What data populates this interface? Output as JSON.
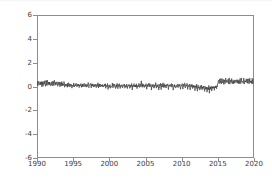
{
  "chart_data": {
    "type": "line",
    "title": "",
    "xlabel": "",
    "ylabel": "",
    "xlim": [
      1990,
      2020
    ],
    "ylim": [
      -6,
      6
    ],
    "grid": false,
    "legend": null,
    "line_color": "#3a3a3a",
    "axis_color": "#8d8d8d",
    "tick_label_color": "#3d3d3d",
    "background_color": "#ffffff",
    "xticks": [
      1990,
      1995,
      2000,
      2005,
      2010,
      2015,
      2020
    ],
    "xtick_labels": [
      "1990",
      "1995",
      "2000",
      "2005",
      "2010",
      "2015",
      "2020"
    ],
    "yticks": [
      -6,
      -4,
      -2,
      0,
      2,
      4,
      6
    ],
    "ytick_labels": [
      "-6",
      "-4",
      "-2",
      "0",
      "2",
      "4",
      "6"
    ],
    "series": [
      {
        "name": "residual-series",
        "x": [
          1990.0,
          1990.08,
          1990.17,
          1990.25,
          1990.33,
          1990.42,
          1990.5,
          1990.58,
          1990.67,
          1990.75,
          1990.83,
          1990.92,
          1991.0,
          1991.08,
          1991.17,
          1991.25,
          1991.33,
          1991.42,
          1991.5,
          1991.58,
          1991.67,
          1991.75,
          1991.83,
          1991.92,
          1992.0,
          1992.08,
          1992.17,
          1992.25,
          1992.33,
          1992.42,
          1992.5,
          1992.58,
          1992.67,
          1992.75,
          1992.83,
          1992.92,
          1993.0,
          1993.08,
          1993.17,
          1993.25,
          1993.33,
          1993.42,
          1993.5,
          1993.58,
          1993.67,
          1993.75,
          1993.83,
          1993.92,
          1994.0,
          1994.08,
          1994.17,
          1994.25,
          1994.33,
          1994.42,
          1994.5,
          1994.58,
          1994.67,
          1994.75,
          1994.83,
          1994.92,
          1995.0,
          1995.08,
          1995.17,
          1995.25,
          1995.33,
          1995.42,
          1995.5,
          1995.58,
          1995.67,
          1995.75,
          1995.83,
          1995.92,
          1996.0,
          1996.08,
          1996.17,
          1996.25,
          1996.33,
          1996.42,
          1996.5,
          1996.58,
          1996.67,
          1996.75,
          1996.83,
          1996.92,
          1997.0,
          1997.08,
          1997.17,
          1997.25,
          1997.33,
          1997.42,
          1997.5,
          1997.58,
          1997.67,
          1997.75,
          1997.83,
          1997.92,
          1998.0,
          1998.08,
          1998.17,
          1998.25,
          1998.33,
          1998.42,
          1998.5,
          1998.58,
          1998.67,
          1998.75,
          1998.83,
          1998.92,
          1999.0,
          1999.08,
          1999.17,
          1999.25,
          1999.33,
          1999.42,
          1999.5,
          1999.58,
          1999.67,
          1999.75,
          1999.83,
          1999.92,
          2000.0,
          2000.08,
          2000.17,
          2000.25,
          2000.33,
          2000.42,
          2000.5,
          2000.58,
          2000.67,
          2000.75,
          2000.83,
          2000.92,
          2001.0,
          2001.08,
          2001.17,
          2001.25,
          2001.33,
          2001.42,
          2001.5,
          2001.58,
          2001.67,
          2001.75,
          2001.83,
          2001.92,
          2002.0,
          2002.08,
          2002.17,
          2002.25,
          2002.33,
          2002.42,
          2002.5,
          2002.58,
          2002.67,
          2002.75,
          2002.83,
          2002.92,
          2003.0,
          2003.08,
          2003.17,
          2003.25,
          2003.33,
          2003.42,
          2003.5,
          2003.58,
          2003.67,
          2003.75,
          2003.83,
          2003.92,
          2004.0,
          2004.08,
          2004.17,
          2004.25,
          2004.33,
          2004.42,
          2004.5,
          2004.58,
          2004.67,
          2004.75,
          2004.83,
          2004.92,
          2005.0,
          2005.08,
          2005.17,
          2005.25,
          2005.33,
          2005.42,
          2005.5,
          2005.58,
          2005.67,
          2005.75,
          2005.83,
          2005.92,
          2006.0,
          2006.08,
          2006.17,
          2006.25,
          2006.33,
          2006.42,
          2006.5,
          2006.58,
          2006.67,
          2006.75,
          2006.83,
          2006.92,
          2007.0,
          2007.08,
          2007.17,
          2007.25,
          2007.33,
          2007.42,
          2007.5,
          2007.58,
          2007.67,
          2007.75,
          2007.83,
          2007.92,
          2008.0,
          2008.08,
          2008.17,
          2008.25,
          2008.33,
          2008.42,
          2008.5,
          2008.58,
          2008.67,
          2008.75,
          2008.83,
          2008.92,
          2009.0,
          2009.08,
          2009.17,
          2009.25,
          2009.33,
          2009.42,
          2009.5,
          2009.58,
          2009.67,
          2009.75,
          2009.83,
          2009.92,
          2010.0,
          2010.08,
          2010.17,
          2010.25,
          2010.33,
          2010.42,
          2010.5,
          2010.58,
          2010.67,
          2010.75,
          2010.83,
          2010.92,
          2011.0,
          2011.08,
          2011.17,
          2011.25,
          2011.33,
          2011.42,
          2011.5,
          2011.58,
          2011.67,
          2011.75,
          2011.83,
          2011.92,
          2012.0,
          2012.08,
          2012.17,
          2012.25,
          2012.33,
          2012.42,
          2012.5,
          2012.58,
          2012.67,
          2012.75,
          2012.83,
          2012.92,
          2013.0,
          2013.08,
          2013.17,
          2013.25,
          2013.33,
          2013.42,
          2013.5,
          2013.58,
          2013.67,
          2013.75,
          2013.83,
          2013.92,
          2014.0,
          2014.08,
          2014.17,
          2014.25,
          2014.33,
          2014.42,
          2014.5,
          2014.58,
          2014.67,
          2014.75,
          2014.83,
          2014.92,
          2015.0,
          2015.08,
          2015.17,
          2015.25,
          2015.33,
          2015.42,
          2015.5,
          2015.58,
          2015.67,
          2015.75,
          2015.83,
          2015.92,
          2016.0,
          2016.08,
          2016.17,
          2016.25,
          2016.33,
          2016.42,
          2016.5,
          2016.58,
          2016.67,
          2016.75,
          2016.83,
          2016.92,
          2017.0,
          2017.08,
          2017.17,
          2017.25,
          2017.33,
          2017.42,
          2017.5,
          2017.58,
          2017.67,
          2017.75,
          2017.83,
          2017.92,
          2018.0,
          2018.08,
          2018.17,
          2018.25,
          2018.33,
          2018.42,
          2018.5,
          2018.58,
          2018.67,
          2018.75,
          2018.83,
          2018.92,
          2019.0,
          2019.08,
          2019.17,
          2019.25,
          2019.33,
          2019.42,
          2019.5,
          2019.58,
          2019.67,
          2019.75,
          2019.83,
          2019.92
        ],
        "y": [
          0.05,
          0.3,
          0.1,
          0.42,
          0.08,
          0.35,
          0.12,
          0.48,
          0.06,
          0.33,
          0.15,
          0.4,
          0.1,
          0.45,
          0.05,
          0.38,
          0.18,
          0.52,
          0.09,
          0.36,
          0.14,
          0.44,
          0.07,
          0.3,
          0.12,
          0.5,
          0.08,
          0.4,
          0.2,
          0.55,
          0.1,
          0.35,
          0.16,
          0.46,
          0.06,
          0.28,
          0.14,
          0.42,
          0.04,
          0.33,
          0.11,
          0.39,
          0.07,
          0.3,
          0.13,
          0.36,
          0.05,
          0.25,
          0.08,
          0.28,
          0.02,
          0.22,
          0.09,
          0.31,
          0.03,
          0.2,
          0.1,
          0.26,
          0.01,
          0.18,
          0.06,
          0.24,
          -0.02,
          0.16,
          0.07,
          0.27,
          0.0,
          0.19,
          0.08,
          0.22,
          -0.03,
          0.14,
          0.05,
          0.2,
          -0.05,
          0.13,
          0.06,
          0.24,
          -0.01,
          0.17,
          0.04,
          0.21,
          -0.04,
          0.12,
          0.07,
          0.26,
          0.0,
          0.18,
          0.09,
          0.23,
          -0.02,
          0.15,
          0.05,
          0.19,
          -0.06,
          0.11,
          0.03,
          0.22,
          -0.08,
          0.14,
          0.06,
          0.25,
          -0.03,
          0.16,
          0.02,
          0.2,
          -0.1,
          0.1,
          0.04,
          0.18,
          -0.12,
          0.12,
          0.05,
          0.21,
          -0.05,
          0.15,
          0.01,
          0.17,
          -0.14,
          0.08,
          0.02,
          0.16,
          -0.18,
          0.1,
          0.04,
          0.19,
          -0.08,
          0.13,
          0.0,
          0.15,
          -0.2,
          0.07,
          0.03,
          0.17,
          -0.15,
          0.11,
          0.05,
          0.2,
          -0.06,
          0.14,
          0.01,
          0.16,
          -0.16,
          0.09,
          0.02,
          0.15,
          -0.22,
          0.08,
          0.03,
          0.18,
          -0.1,
          0.12,
          -0.01,
          0.14,
          -0.18,
          0.06,
          0.01,
          0.16,
          -0.2,
          0.09,
          0.04,
          0.19,
          -0.07,
          0.13,
          0.0,
          0.15,
          -0.24,
          0.05,
          0.03,
          0.2,
          -0.12,
          0.14,
          0.06,
          0.38,
          -0.04,
          0.18,
          0.02,
          0.16,
          -0.15,
          0.08,
          0.04,
          0.22,
          -0.18,
          0.12,
          0.05,
          0.24,
          -0.06,
          0.16,
          0.01,
          0.18,
          -0.2,
          0.07,
          0.02,
          0.19,
          -0.14,
          0.11,
          0.04,
          0.26,
          -0.08,
          0.15,
          0.0,
          0.17,
          -0.22,
          0.06,
          0.03,
          0.21,
          -0.16,
          0.13,
          0.05,
          0.23,
          -0.05,
          0.16,
          0.01,
          0.19,
          -0.18,
          0.09,
          0.02,
          0.18,
          -0.2,
          0.1,
          0.04,
          0.22,
          -0.09,
          0.14,
          -0.01,
          0.16,
          -0.24,
          0.05,
          0.01,
          0.17,
          -0.16,
          0.11,
          0.03,
          0.2,
          -0.07,
          0.13,
          0.0,
          0.15,
          -0.19,
          0.07,
          0.02,
          0.19,
          -0.14,
          0.12,
          0.05,
          0.24,
          -0.06,
          0.16,
          0.02,
          0.18,
          -0.16,
          0.08,
          0.03,
          0.16,
          -0.2,
          0.09,
          0.01,
          0.17,
          -0.12,
          0.11,
          -0.02,
          0.12,
          -0.26,
          0.02,
          -0.05,
          0.1,
          -0.28,
          0.04,
          -0.08,
          0.08,
          -0.3,
          0.01,
          -0.12,
          0.05,
          -0.34,
          -0.02,
          -0.14,
          0.02,
          -0.38,
          -0.05,
          -0.18,
          0.0,
          -0.42,
          -0.08,
          -0.22,
          -0.02,
          -0.46,
          -0.12,
          -0.2,
          0.02,
          -0.4,
          -0.06,
          -0.16,
          0.05,
          -0.34,
          -0.02,
          -0.1,
          0.08,
          -0.24,
          0.04,
          0.2,
          0.55,
          0.28,
          0.62,
          0.3,
          0.58,
          0.26,
          0.64,
          0.32,
          0.6,
          0.24,
          0.56,
          0.3,
          0.66,
          0.34,
          0.58,
          0.28,
          0.62,
          0.3,
          0.68,
          0.26,
          0.54,
          0.32,
          0.6,
          0.28,
          0.58,
          0.3,
          0.64,
          0.24,
          0.56,
          0.34,
          0.62,
          0.28,
          0.52,
          0.3,
          0.58,
          0.26,
          0.6,
          0.32,
          0.66,
          0.28,
          0.54,
          0.3,
          0.62,
          0.24,
          0.58,
          0.34,
          0.64,
          0.3,
          0.56,
          0.26,
          0.6,
          0.32,
          0.68,
          0.28,
          0.54,
          0.3,
          0.62,
          0.26,
          0.58
        ]
      }
    ]
  }
}
